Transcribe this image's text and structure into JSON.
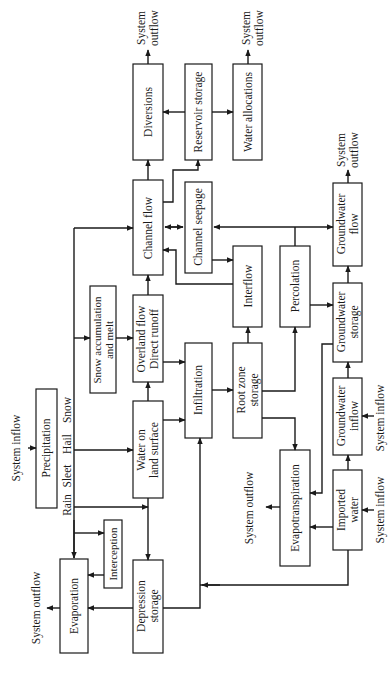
{
  "diagram": {
    "orientation": "rotated-90-ccw",
    "nodes": {
      "precipitation": {
        "label": "Precipitation"
      },
      "rain": {
        "label": "Rain"
      },
      "sleet": {
        "label": "Sleet"
      },
      "hail": {
        "label": "Hail"
      },
      "snow": {
        "label": "Snow"
      },
      "snow_accumulation": {
        "line1": "Snow accumulation",
        "line2": "and melt"
      },
      "interception": {
        "label": "Interception"
      },
      "evaporation": {
        "label": "Evaporation"
      },
      "water_on_land": {
        "line1": "Water on",
        "line2": "land surface"
      },
      "depression_storage": {
        "line1": "Depression",
        "line2": "storage"
      },
      "overland_flow": {
        "line1": "Overland flow",
        "line2": "Direct runoff"
      },
      "infiltration": {
        "label": "Infiltration"
      },
      "root_zone": {
        "line1": "Root zone",
        "line2": "storage"
      },
      "channel_flow": {
        "label": "Channel flow"
      },
      "channel_seepage": {
        "label": "Channel seepage"
      },
      "interflow": {
        "label": "Interflow"
      },
      "percolation": {
        "label": "Percolation"
      },
      "evapotranspiration": {
        "label": "Evapotranspiration"
      },
      "diversions": {
        "label": "Diversions"
      },
      "reservoir_storage": {
        "label": "Reservoir storage"
      },
      "water_allocations": {
        "label": "Water allocations"
      },
      "groundwater_flow": {
        "line1": "Groundwater",
        "line2": "flow"
      },
      "groundwater_storage": {
        "line1": "Groundwater",
        "line2": "storage"
      },
      "groundwater_inflow": {
        "line1": "Groundwater",
        "line2": "inflow"
      },
      "imported_water": {
        "line1": "Imported",
        "line2": "water"
      }
    },
    "boundary_labels": {
      "system_inflow": "System inflow",
      "system_outflow": "System outflow",
      "system": "System",
      "outflow": "outflow"
    },
    "edges": [
      [
        "System inflow",
        "Precipitation"
      ],
      [
        "Precipitation (Rain)",
        "Evaporation"
      ],
      [
        "Precipitation (Rain)",
        "Interception"
      ],
      [
        "Precipitation (Rain)",
        "Depression storage"
      ],
      [
        "Precipitation (Hail)",
        "Water on land surface"
      ],
      [
        "Precipitation (Snow)",
        "Snow accumulation and melt"
      ],
      [
        "Precipitation",
        "Channel flow"
      ],
      [
        "Interception",
        "Evaporation"
      ],
      [
        "Evaporation",
        "System outflow"
      ],
      [
        "Depression storage",
        "Evaporation"
      ],
      [
        "Depression storage",
        "Infiltration"
      ],
      [
        "Water on land surface",
        "Depression storage"
      ],
      [
        "Water on land surface",
        "Infiltration"
      ],
      [
        "Water on land surface",
        "Overland flow / Direct runoff"
      ],
      [
        "Snow accumulation and melt",
        "Overland flow / Direct runoff"
      ],
      [
        "Overland flow / Direct runoff",
        "Channel flow"
      ],
      [
        "Overland flow / Direct runoff",
        "Infiltration"
      ],
      [
        "Infiltration",
        "Root zone storage"
      ],
      [
        "Root zone storage",
        "Interflow"
      ],
      [
        "Root zone storage",
        "Percolation"
      ],
      [
        "Root zone storage",
        "Evapotranspiration"
      ],
      [
        "Interflow",
        "Channel flow"
      ],
      [
        "Channel seepage",
        "Interflow"
      ],
      [
        "Channel flow",
        "Channel seepage"
      ],
      [
        "Channel seepage",
        "Channel flow"
      ],
      [
        "Channel flow",
        "Diversions"
      ],
      [
        "Channel flow",
        "Reservoir storage"
      ],
      [
        "Reservoir storage",
        "Diversions"
      ],
      [
        "Reservoir storage",
        "Water allocations"
      ],
      [
        "Diversions",
        "System outflow"
      ],
      [
        "Water allocations",
        "System outflow"
      ],
      [
        "Percolation",
        "Groundwater storage"
      ],
      [
        "Percolation",
        "Channel seepage / Groundwater flow"
      ],
      [
        "Groundwater storage",
        "Groundwater flow"
      ],
      [
        "Groundwater storage",
        "Evapotranspiration"
      ],
      [
        "Groundwater flow",
        "System outflow"
      ],
      [
        "Groundwater inflow",
        "Groundwater storage"
      ],
      [
        "System inflow",
        "Groundwater inflow"
      ],
      [
        "System inflow",
        "Imported water"
      ],
      [
        "Imported water",
        "Groundwater inflow"
      ],
      [
        "Imported water",
        "Evapotranspiration"
      ],
      [
        "Imported water",
        "Infiltration"
      ],
      [
        "Evapotranspiration",
        "System outflow"
      ]
    ]
  }
}
